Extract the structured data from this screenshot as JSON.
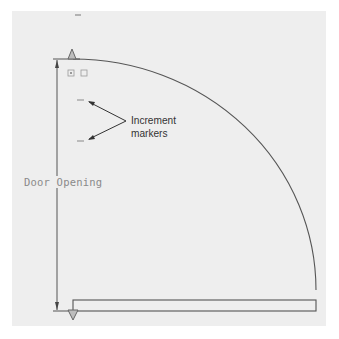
{
  "diagram": {
    "type": "door-swing-plan",
    "labels": {
      "dimension": "Door Opening",
      "callout_line1": "Increment",
      "callout_line2": "markers"
    },
    "colors": {
      "background": "#ffffff",
      "panel": "#eeeeee",
      "line": "#555555",
      "dim_text": "#8a8a8a",
      "callout_text": "#333333",
      "grip": "#777777"
    },
    "elements": [
      {
        "id": "swing-arc",
        "kind": "quarter-circle arc",
        "description": "Door swing path from top hinge to door leaf end"
      },
      {
        "id": "door-leaf",
        "kind": "rectangle",
        "description": "Door leaf along bottom edge"
      },
      {
        "id": "dimension-line",
        "kind": "vertical dimension",
        "description": "Door Opening dimension with arrowheads"
      },
      {
        "id": "top-grip",
        "kind": "triangle grip",
        "description": "Grip at top of swing"
      },
      {
        "id": "bottom-grip",
        "kind": "triangle grip",
        "description": "Grip at bottom hinge"
      },
      {
        "id": "increment-markers",
        "kind": "tick marks",
        "count": 2
      }
    ]
  }
}
